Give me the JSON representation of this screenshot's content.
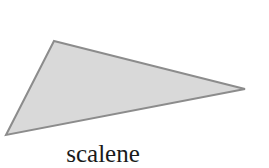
{
  "figure": {
    "shape": "triangle",
    "vertices": [
      [
        54,
        41
      ],
      [
        245,
        89
      ],
      [
        6,
        135
      ]
    ],
    "fill": "#d9d9d9",
    "stroke": "#8c8c8c"
  },
  "caption": "scalene"
}
